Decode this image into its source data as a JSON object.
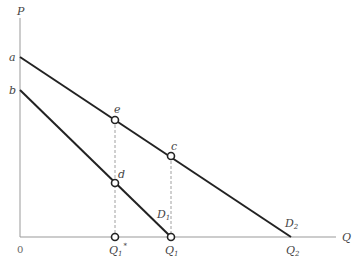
{
  "diagram": {
    "type": "economics-demand-shift",
    "axes": {
      "y_label": "P",
      "x_label": "Q",
      "origin_label": "0"
    },
    "intercepts": {
      "a": "a",
      "b": "b"
    },
    "curves": [
      {
        "name": "D1",
        "label_main": "D",
        "label_sub": "1",
        "from": "b",
        "to": "Q1"
      },
      {
        "name": "D2",
        "label_main": "D",
        "label_sub": "2",
        "from": "a",
        "to": "Q2"
      }
    ],
    "points": {
      "e": "e",
      "c": "c",
      "d": "d"
    },
    "x_ticks": [
      {
        "main": "Q",
        "sub": "1",
        "sup": "*"
      },
      {
        "main": "Q",
        "sub": "1",
        "sup": ""
      },
      {
        "main": "Q",
        "sub": "2",
        "sup": ""
      }
    ]
  }
}
